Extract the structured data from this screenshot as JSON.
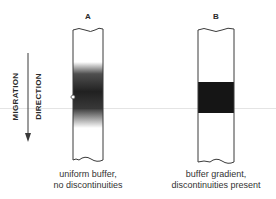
{
  "figure": {
    "type": "diagram"
  },
  "migration_arrow": {
    "line1": "MIGRATION",
    "line2": "DIRECTION",
    "direction": "down"
  },
  "columns": [
    {
      "label": "A",
      "band_style": "diffuse gradient band",
      "caption_line1": "uniform buffer,",
      "caption_line2": "no discontinuities"
    },
    {
      "label": "B",
      "band_style": "sharp dark band",
      "caption_line1": "buffer gradient,",
      "caption_line2": "discontinuities present"
    }
  ],
  "colors": {
    "outline": "#3a3a3a",
    "band_dark": "#151515",
    "background": "#ffffff"
  }
}
